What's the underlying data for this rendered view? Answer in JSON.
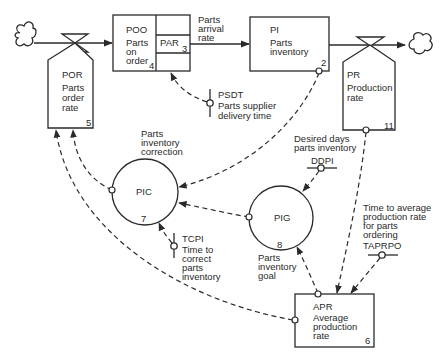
{
  "diagram": {
    "type": "system-dynamics-flow-diagram",
    "nodes": {
      "poo": {
        "abbr": "POO",
        "l1": "Parts",
        "l2": "on",
        "l3": "order",
        "num": "4",
        "kind": "level"
      },
      "par": {
        "abbr": "PAR",
        "num": "3",
        "kind": "rate"
      },
      "par_label": {
        "l1": "Parts",
        "l2": "arrival",
        "l3": "rate"
      },
      "pi": {
        "abbr": "PI",
        "l1": "Parts",
        "l2": "inventory",
        "num": "2",
        "kind": "level"
      },
      "por": {
        "abbr": "POR",
        "l1": "Parts",
        "l2": "order",
        "l3": "rate",
        "num": "5",
        "kind": "rate"
      },
      "pr": {
        "abbr": "PR",
        "l1": "Production",
        "l2": "rate",
        "num": "11",
        "kind": "rate"
      },
      "pic": {
        "abbr": "PIC",
        "num": "7",
        "l1": "Parts",
        "l2": "inventory",
        "l3": "correction",
        "kind": "auxiliary"
      },
      "pig": {
        "abbr": "PIG",
        "num": "8",
        "l1": "Parts",
        "l2": "inventory",
        "l3": "goal",
        "kind": "auxiliary"
      },
      "apr": {
        "abbr": "APR",
        "l1": "Average",
        "l2": "production",
        "l3": "rate",
        "num": "6",
        "kind": "level"
      },
      "psdt": {
        "abbr": "PSDT",
        "l1": "Parts supplier",
        "l2": "delivery time",
        "kind": "constant"
      },
      "tcpi": {
        "abbr": "TCPI",
        "l1": "Time to",
        "l2": "correct",
        "l3": "parts",
        "l4": "inventory",
        "kind": "constant"
      },
      "ddpi": {
        "abbr": "DDPI",
        "l1": "Desired days",
        "l2": "parts inventory",
        "kind": "constant"
      },
      "taprpo": {
        "abbr": "TAPRPO",
        "l1": "Time to average",
        "l2": "production rate",
        "l3": "for parts",
        "l4": "ordering",
        "kind": "constant"
      }
    },
    "edges": [
      {
        "from": "source",
        "to": "poo",
        "style": "solid",
        "via": "POR"
      },
      {
        "from": "poo",
        "to": "pi",
        "style": "solid",
        "via": "PAR"
      },
      {
        "from": "pi",
        "to": "sink",
        "style": "solid",
        "via": "PR"
      },
      {
        "from": "psdt",
        "to": "par",
        "style": "dashed"
      },
      {
        "from": "pi",
        "to": "pic",
        "style": "dashed"
      },
      {
        "from": "pic",
        "to": "por",
        "style": "dashed"
      },
      {
        "from": "apr",
        "to": "por",
        "style": "dashed"
      },
      {
        "from": "pig",
        "to": "pic",
        "style": "dashed"
      },
      {
        "from": "tcpi",
        "to": "pic",
        "style": "dashed"
      },
      {
        "from": "ddpi",
        "to": "pig",
        "style": "dashed"
      },
      {
        "from": "apr",
        "to": "pig",
        "style": "dashed"
      },
      {
        "from": "pr",
        "to": "apr",
        "style": "dashed"
      },
      {
        "from": "taprpo",
        "to": "apr",
        "style": "dashed"
      }
    ],
    "colors": {
      "line": "#2a2a2a",
      "background": "#ffffff"
    }
  }
}
